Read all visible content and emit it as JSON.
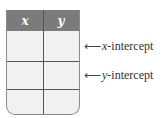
{
  "table": {
    "headers": [
      "x",
      "y"
    ],
    "rows": [
      [
        "",
        ""
      ],
      [
        "",
        ""
      ],
      [
        "",
        ""
      ]
    ]
  },
  "annotations": [
    {
      "arrow": "⟵",
      "var": "x",
      "text": "-intercept",
      "row": 0
    },
    {
      "arrow": "⟵",
      "var": "y",
      "text": "-intercept",
      "row": 1
    }
  ],
  "colors": {
    "header_bg": "#7b7b7b",
    "cell_bg": "#f1f1f1",
    "grid": "#555555"
  }
}
